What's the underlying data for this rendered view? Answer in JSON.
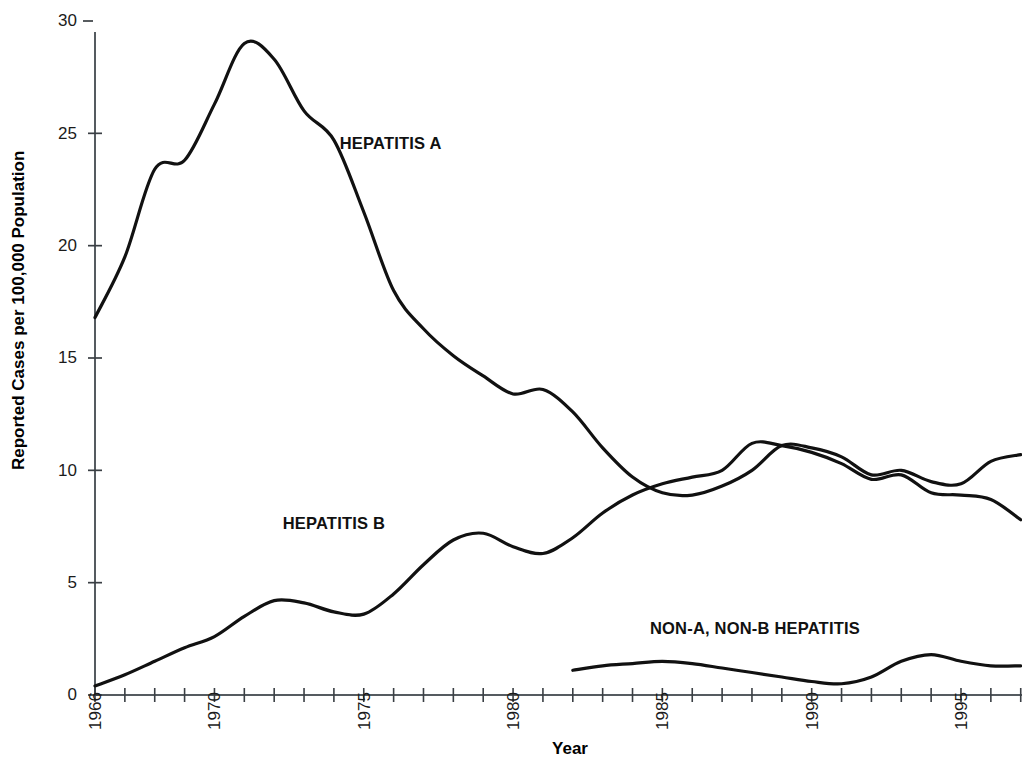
{
  "chart_data": {
    "type": "line",
    "title": "",
    "xlabel": "Year",
    "ylabel": "Reported Cases per 100,000 Population",
    "xlim": [
      1966,
      1997
    ],
    "ylim": [
      0,
      30
    ],
    "grid": false,
    "legend_position": "inline-annotations",
    "y_ticks": [
      0,
      5,
      10,
      15,
      20,
      25,
      30
    ],
    "y_tick_labels": [
      "0",
      "5",
      "10",
      "15",
      "20",
      "25",
      "30"
    ],
    "x_ticks": [
      1966,
      1967,
      1968,
      1969,
      1970,
      1971,
      1972,
      1973,
      1974,
      1975,
      1976,
      1977,
      1978,
      1979,
      1980,
      1981,
      1982,
      1983,
      1984,
      1985,
      1986,
      1987,
      1988,
      1989,
      1990,
      1991,
      1992,
      1993,
      1994,
      1995,
      1996,
      1997
    ],
    "x_tick_labels": [
      "1966",
      "1970",
      "1975",
      "1980",
      "1985",
      "1990",
      "1995"
    ],
    "x_labeled_ticks": [
      1966,
      1970,
      1975,
      1980,
      1985,
      1990,
      1995
    ],
    "series": [
      {
        "name": "HEPATITIS A",
        "label": "HEPATITIS A",
        "color": "#111111",
        "x": [
          1966,
          1967,
          1968,
          1969,
          1970,
          1971,
          1972,
          1973,
          1974,
          1975,
          1976,
          1977,
          1978,
          1979,
          1980,
          1981,
          1982,
          1983,
          1984,
          1985,
          1986,
          1987,
          1988,
          1989,
          1990,
          1991,
          1992,
          1993,
          1994,
          1995,
          1996,
          1997
        ],
        "values": [
          16.8,
          19.5,
          23.4,
          23.8,
          26.3,
          29.0,
          28.3,
          26.0,
          24.7,
          21.5,
          18.0,
          16.3,
          15.1,
          14.2,
          13.4,
          13.6,
          12.6,
          11.0,
          9.7,
          9.0,
          8.9,
          9.3,
          10.0,
          11.1,
          11.0,
          10.6,
          9.8,
          10.0,
          9.5,
          9.4,
          10.4,
          10.7
        ],
        "label_x": 1975.9,
        "label_y": 24.3
      },
      {
        "name": "HEPATITIS B",
        "label": "HEPATITIS B",
        "color": "#111111",
        "x": [
          1966,
          1967,
          1968,
          1969,
          1970,
          1971,
          1972,
          1973,
          1974,
          1975,
          1976,
          1977,
          1978,
          1979,
          1980,
          1981,
          1982,
          1983,
          1984,
          1985,
          1986,
          1987,
          1988,
          1989,
          1990,
          1991,
          1992,
          1993,
          1994,
          1995,
          1996,
          1997
        ],
        "values": [
          0.4,
          0.9,
          1.5,
          2.1,
          2.6,
          3.5,
          4.2,
          4.1,
          3.7,
          3.6,
          4.5,
          5.8,
          6.9,
          7.2,
          6.6,
          6.3,
          7.0,
          8.1,
          8.9,
          9.4,
          9.7,
          10.0,
          11.2,
          11.1,
          10.8,
          10.3,
          9.6,
          9.8,
          9.0,
          8.9,
          8.7,
          7.8
        ],
        "label_x": 1974.0,
        "label_y": 7.4
      },
      {
        "name": "NON-A, NON-B HEPATITIS",
        "label": "NON-A, NON-B HEPATITIS",
        "color": "#111111",
        "x": [
          1982,
          1983,
          1984,
          1985,
          1986,
          1987,
          1988,
          1989,
          1990,
          1991,
          1992,
          1993,
          1994,
          1995,
          1996,
          1997
        ],
        "values": [
          1.1,
          1.3,
          1.4,
          1.5,
          1.4,
          1.2,
          1.0,
          0.8,
          0.6,
          0.5,
          0.8,
          1.5,
          1.8,
          1.5,
          1.3,
          1.3
        ],
        "label_x": 1988.1,
        "label_y": 2.7
      }
    ]
  },
  "axes": {
    "y_label": "Reported Cases per 100,000 Population",
    "x_label": "Year"
  },
  "y_tick_labels": [
    "0",
    "5",
    "10",
    "15",
    "20",
    "25",
    "30"
  ],
  "x_tick_labels": [
    "1966",
    "1970",
    "1975",
    "1980",
    "1985",
    "1990",
    "1995"
  ],
  "series_labels": {
    "hep_a": "HEPATITIS A",
    "hep_b": "HEPATITIS B",
    "nanb": "NON-A, NON-B HEPATITIS"
  }
}
